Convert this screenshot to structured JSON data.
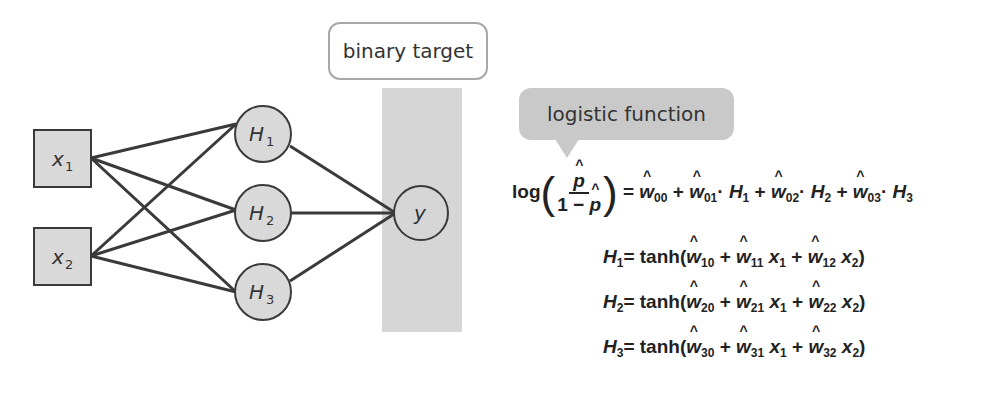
{
  "diagram": {
    "inputs": [
      {
        "id": "x1",
        "label": "x",
        "sub": "1"
      },
      {
        "id": "x2",
        "label": "x",
        "sub": "2"
      }
    ],
    "hidden": [
      {
        "id": "H1",
        "label": "H",
        "sub": "1"
      },
      {
        "id": "H2",
        "label": "H",
        "sub": "2"
      },
      {
        "id": "H3",
        "label": "H",
        "sub": "3"
      }
    ],
    "output": {
      "id": "y",
      "label": "y"
    },
    "edges": [
      [
        "x1",
        "H1"
      ],
      [
        "x1",
        "H2"
      ],
      [
        "x1",
        "H3"
      ],
      [
        "x2",
        "H1"
      ],
      [
        "x2",
        "H2"
      ],
      [
        "x2",
        "H3"
      ],
      [
        "H1",
        "y"
      ],
      [
        "H2",
        "y"
      ],
      [
        "H3",
        "y"
      ]
    ],
    "callouts": {
      "target": "binary target",
      "logistic": "logistic function"
    },
    "colors": {
      "node_fill": "#d9d9d9",
      "stroke": "#3a3a3a",
      "band": "#d6d6d6",
      "callout_fill": "#c9c9c9",
      "callout_border": "#a8a8a8"
    }
  },
  "equations": {
    "logit": {
      "lhs_fn": "log",
      "num": "p",
      "den_prefix": "1 − ",
      "den": "p",
      "equals": "=",
      "terms": [
        {
          "w": "w",
          "sub": "00",
          "var": "",
          "var_sub": ""
        },
        {
          "w": "w",
          "sub": "01",
          "var": "H",
          "var_sub": "1"
        },
        {
          "w": "w",
          "sub": "02",
          "var": "H",
          "var_sub": "2"
        },
        {
          "w": "w",
          "sub": "03",
          "var": "H",
          "var_sub": "3"
        }
      ]
    },
    "hidden": [
      {
        "lhs": "H",
        "lhs_sub": "1",
        "fn": "tanh(",
        "w0": "10",
        "w1": "11",
        "w2": "12"
      },
      {
        "lhs": "H",
        "lhs_sub": "2",
        "fn": "tanh(",
        "w0": "20",
        "w1": "21",
        "w2": "22"
      },
      {
        "lhs": "H",
        "lhs_sub": "3",
        "fn": "tanh(",
        "w0": "30",
        "w1": "31",
        "w2": "32"
      }
    ],
    "symbols": {
      "plus": " + ",
      "eq": "= ",
      "close": ")",
      "w": "w",
      "x": "x",
      "x1_sub": "1",
      "x2_sub": "2",
      "dot": "·"
    }
  }
}
